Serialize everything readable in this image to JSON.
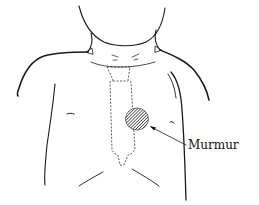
{
  "figure": {
    "annotation": {
      "label": "Murmur",
      "marker": "hatched circle over left sternal border"
    },
    "elements": {
      "sternum_outline": "dashed",
      "murmur_area": "hatched"
    },
    "colors": {
      "line": "#1a1a1a",
      "background": "#ffffff"
    }
  }
}
